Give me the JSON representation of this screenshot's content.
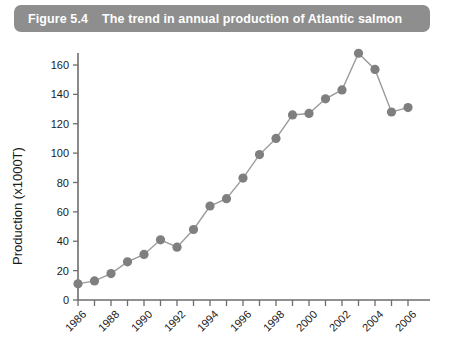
{
  "caption": {
    "number": "Figure 5.4",
    "text": "The trend in annual production of Atlantic salmon"
  },
  "colors": {
    "caption_bar": "#8e8e8e",
    "caption_text": "#ffffff",
    "marker": "#7f7f7f",
    "line": "#9b9b9b",
    "axis": "#6d6d6d"
  },
  "chart_data": {
    "type": "line",
    "title": "The trend in annual production of Atlantic salmon",
    "xlabel": "",
    "ylabel": "Production (x1000T)",
    "x": [
      1986,
      1987,
      1988,
      1989,
      1990,
      1991,
      1992,
      1993,
      1994,
      1995,
      1996,
      1997,
      1998,
      1999,
      2000,
      2001,
      2002,
      2003,
      2004,
      2005,
      2006
    ],
    "values": [
      11,
      13,
      18,
      26,
      31,
      41,
      36,
      48,
      64,
      69,
      83,
      99,
      110,
      126,
      127,
      137,
      143,
      168,
      157,
      128,
      131
    ],
    "xlim": [
      1986,
      2006
    ],
    "ylim": [
      0,
      170
    ],
    "yticks": [
      0,
      20,
      40,
      60,
      80,
      100,
      120,
      140,
      160
    ],
    "ytick_labels": [
      "0",
      "20",
      "40",
      "60",
      "80",
      "100",
      "120",
      "140",
      "160"
    ],
    "xticks": [
      1986,
      1988,
      1990,
      1992,
      1994,
      1996,
      1998,
      2000,
      2002,
      2004,
      2006
    ],
    "xtick_labels": [
      "1986",
      "1988",
      "1990",
      "1992",
      "1994",
      "1996",
      "1998",
      "2000",
      "2002",
      "2004",
      "2006"
    ],
    "xtick_minor": [
      1987,
      1989,
      1991,
      1993,
      1995,
      1997,
      1999,
      2001,
      2003,
      2005
    ],
    "grid": false,
    "legend": false,
    "marker": "circle"
  }
}
